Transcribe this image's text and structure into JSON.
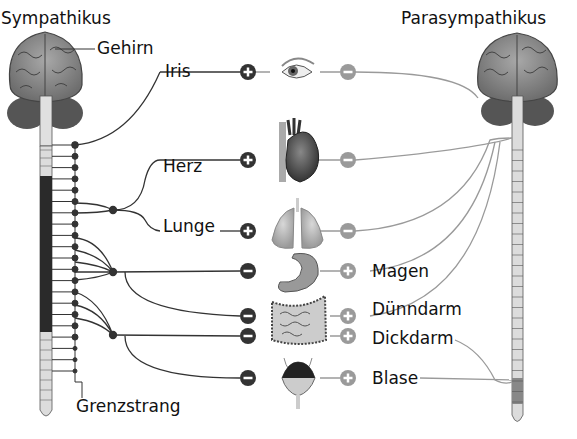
{
  "titles": {
    "sympathikus": "Sympathikus",
    "parasympathikus": "Parasympathikus"
  },
  "labels": {
    "gehirn": "Gehirn",
    "iris": "Iris",
    "herz": "Herz",
    "lunge": "Lunge",
    "magen": "Magen",
    "duenndarm": "Dünndarm",
    "dickdarm": "Dickdarm",
    "blase": "Blase",
    "grenzstrang": "Grenzstrang"
  },
  "organs": [
    {
      "name": "Iris",
      "y": 72,
      "symp": "+",
      "para": "−"
    },
    {
      "name": "Herz",
      "y": 160,
      "symp": "+",
      "para": "−"
    },
    {
      "name": "Lunge",
      "y": 231,
      "symp": "+",
      "para": "−"
    },
    {
      "name": "Magen",
      "y": 271,
      "symp": "−",
      "para": "+"
    },
    {
      "name": "Dünndarm",
      "y": 316,
      "symp": "−",
      "para": "+"
    },
    {
      "name": "Dickdarm",
      "y": 336,
      "symp": "−",
      "para": "+"
    },
    {
      "name": "Blase",
      "y": 378,
      "symp": "−",
      "para": "+"
    }
  ],
  "colors": {
    "sympathetic": "#333333",
    "parasympathetic": "#9a9a9a",
    "brain": "#8c8c8c",
    "spine_light": "#dcdcdc",
    "spine_dark": "#2a2a2a"
  }
}
